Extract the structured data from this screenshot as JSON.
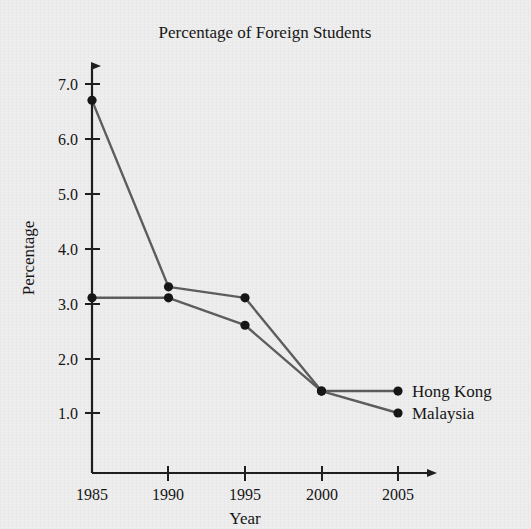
{
  "chart_data": {
    "type": "line",
    "title": "Percentage of Foreign Students",
    "xlabel": "Year",
    "ylabel": "Percentage",
    "categories": [
      "1985",
      "1990",
      "1995",
      "2000",
      "2005"
    ],
    "x": [
      1985,
      1990,
      1995,
      2000,
      2005
    ],
    "xlim": [
      1985,
      2005
    ],
    "ylim": [
      0,
      7.4
    ],
    "yticks": [
      "1.0",
      "2.0",
      "3.0",
      "4.0",
      "5.0",
      "6.0",
      "7.0"
    ],
    "ytick_values": [
      1.0,
      2.0,
      3.0,
      4.0,
      5.0,
      6.0,
      7.0
    ],
    "grid": false,
    "legend_position": "end-of-line-right",
    "series": [
      {
        "name": "Hong Kong",
        "values": [
          6.7,
          3.3,
          3.1,
          1.4,
          1.4
        ],
        "color": "#5a5a5a",
        "marker_color": "#111111"
      },
      {
        "name": "Malaysia",
        "values": [
          3.1,
          3.1,
          2.6,
          1.4,
          1.0
        ],
        "color": "#5a5a5a",
        "marker_color": "#111111"
      }
    ],
    "axis_style": {
      "x_arrow": true,
      "y_arrow": true,
      "axis_color": "#1a1a1a"
    },
    "background_color": "#eeeeee"
  }
}
